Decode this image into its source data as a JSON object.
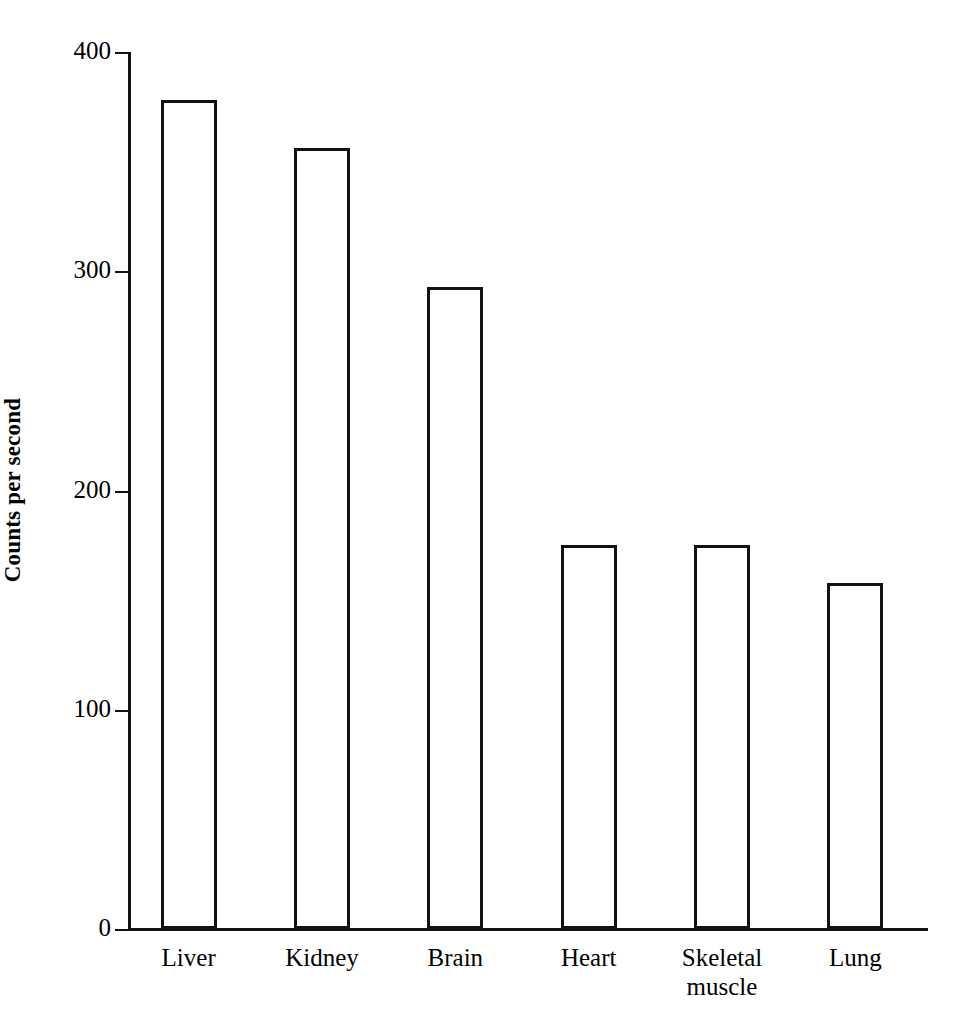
{
  "chart_data": {
    "type": "bar",
    "title": "",
    "xlabel": "",
    "ylabel": "Counts per second",
    "ylim": [
      0,
      400
    ],
    "yticks": [
      0,
      100,
      200,
      300,
      400
    ],
    "ytick_labels": [
      "0",
      "100",
      "200",
      "300",
      "400"
    ],
    "grid": false,
    "legend": "none",
    "bar_style": "open outlined rectangles, white fill, black stroke",
    "categories": [
      "Liver",
      "Kidney",
      "Brain",
      "Heart",
      "Skeletal muscle",
      "Lung"
    ],
    "category_labels": [
      "Liver",
      "Kidney",
      "Brain",
      "Heart",
      "Skeletal\nmuscle",
      "Lung"
    ],
    "values": [
      378,
      356,
      293,
      175,
      175,
      158
    ],
    "series": [
      {
        "name": "Counts per second",
        "values": [
          378,
          356,
          293,
          175,
          175,
          158
        ]
      }
    ]
  },
  "axis": {
    "y_title": "Counts per second"
  }
}
